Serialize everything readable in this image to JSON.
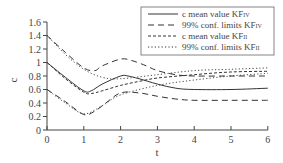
{
  "chart_data": {
    "type": "line",
    "title": "",
    "xlabel": "t",
    "ylabel": "c",
    "xlim": [
      0,
      6
    ],
    "ylim": [
      0,
      1.6
    ],
    "x_ticks": [
      "0",
      "1",
      "2",
      "3",
      "4",
      "5",
      "6"
    ],
    "y_ticks": [
      "0",
      "0.2",
      "0.4",
      "0.6",
      "0.8",
      "1",
      "1.2",
      "1.4",
      "1.6"
    ],
    "grid": false,
    "legend_position": "upper right",
    "series": [
      {
        "name": "c mean value KF_IV",
        "legend_main": "c mean value KF",
        "legend_sub": "IV",
        "style": "solid",
        "x": [
          0,
          0.5,
          1.0,
          1.2,
          1.5,
          2.0,
          2.2,
          2.5,
          3.0,
          3.5,
          4.0,
          5.0,
          6.0
        ],
        "values": [
          1.0,
          0.78,
          0.58,
          0.58,
          0.68,
          0.8,
          0.8,
          0.76,
          0.68,
          0.62,
          0.6,
          0.6,
          0.62
        ]
      },
      {
        "name": "99% conf. limits KF_IV (upper)",
        "legend_main": "99% conf. limits KF",
        "legend_sub": "IV",
        "style": "long-dash",
        "x": [
          0,
          0.5,
          1.0,
          1.3,
          1.5,
          2.0,
          2.3,
          2.7,
          3.0,
          3.5,
          4.0,
          5.0,
          6.0
        ],
        "values": [
          1.4,
          1.15,
          0.92,
          0.88,
          0.95,
          1.05,
          1.03,
          0.95,
          0.88,
          0.82,
          0.8,
          0.8,
          0.8
        ]
      },
      {
        "name": "99% conf. limits KF_IV (lower)",
        "style": "long-dash",
        "x": [
          0,
          0.5,
          1.0,
          1.3,
          1.6,
          2.0,
          2.5,
          3.0,
          3.5,
          4.0,
          5.0,
          6.0
        ],
        "values": [
          0.6,
          0.42,
          0.23,
          0.28,
          0.4,
          0.55,
          0.55,
          0.5,
          0.46,
          0.44,
          0.44,
          0.44
        ]
      },
      {
        "name": "c mean value KF_II",
        "legend_main": "c mean value KF",
        "legend_sub": "II",
        "style": "short-dash",
        "x": [
          0,
          0.5,
          1.0,
          1.2,
          1.5,
          2.0,
          2.5,
          3.0,
          4.0,
          5.0,
          6.0
        ],
        "values": [
          1.0,
          0.76,
          0.56,
          0.54,
          0.58,
          0.66,
          0.72,
          0.77,
          0.82,
          0.86,
          0.87
        ]
      },
      {
        "name": "99% conf. limits KF_II (upper)",
        "legend_main": "99% conf. limits KF",
        "legend_sub": "II",
        "style": "dotted",
        "x": [
          0,
          0.5,
          1.0,
          1.5,
          2.0,
          3.0,
          4.0,
          5.0,
          6.0
        ],
        "values": [
          1.4,
          1.12,
          0.9,
          0.78,
          0.76,
          0.82,
          0.88,
          0.9,
          0.92
        ]
      },
      {
        "name": "99% conf. limits KF_II (lower)",
        "style": "dotted",
        "x": [
          0,
          0.5,
          1.0,
          1.5,
          2.0,
          3.0,
          4.0,
          5.0,
          6.0
        ],
        "values": [
          0.6,
          0.4,
          0.24,
          0.36,
          0.52,
          0.66,
          0.74,
          0.8,
          0.84
        ]
      }
    ]
  },
  "legend": [
    {
      "main": "c mean value KF",
      "sub": "IV",
      "style": "solid"
    },
    {
      "main": "99% conf. limits KF",
      "sub": "IV",
      "style": "long-dash"
    },
    {
      "main": "c mean value KF",
      "sub": "II",
      "style": "short-dash"
    },
    {
      "main": "99% conf. limits KF",
      "sub": "II",
      "style": "dotted"
    }
  ],
  "colors": {
    "line": "#333333",
    "axis": "#444444"
  }
}
